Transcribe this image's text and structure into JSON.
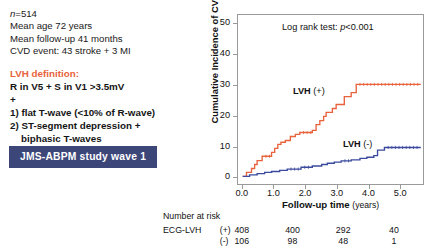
{
  "left_panel": {
    "cohort": [
      "n=514",
      "Mean age 72 years",
      "Mean follow-up 41 months",
      "CVD event: 43 stroke + 3 MI"
    ],
    "n_prefix_italic": "n",
    "lvh_definition_title": "LVH definition:",
    "definition_lines": [
      "R in V5 + S in V1 >3.5mV",
      "+",
      "1) flat T-wave (<10% of R-wave)",
      "2) ST-segment depression +",
      "biphasic T-waves"
    ],
    "badge_label": "JMS-ABPM study wave 1",
    "badge_bg": "#3c4679",
    "badge_fg": "#ffffff",
    "title_color": "#e8623c"
  },
  "chart_data": {
    "type": "line",
    "title": "",
    "xlabel": "Follow-up time",
    "xlabel_unit": "(years)",
    "ylabel": "Cumulative Incidence of CVD events (%)",
    "xlim": [
      -0.15,
      5.75
    ],
    "ylim": [
      -2.5,
      53
    ],
    "xticks": [
      0.0,
      1.0,
      2.0,
      3.0,
      4.0,
      5.0
    ],
    "xticklabels": [
      "0.0",
      "1.0",
      "2.0",
      "3.0",
      "4.0",
      "5.0"
    ],
    "yticks": [
      0,
      10,
      20,
      30,
      40,
      50
    ],
    "yticklabels": [
      "0",
      "10",
      "20",
      "30",
      "40",
      "50"
    ],
    "grid": false,
    "legend_position": "inline-annotation",
    "annotations": [
      {
        "name": "log-rank",
        "text_prefix": "Log rank test: ",
        "text_italic": "p",
        "text_suffix": "<0.001"
      },
      {
        "name": "curve-label-positive",
        "bold": "LVH",
        "rest": " (+)"
      },
      {
        "name": "curve-label-negative",
        "bold": "LVH",
        "rest": " (-)"
      }
    ],
    "series": [
      {
        "name": "LVH (+)",
        "color": "#e8623c",
        "style": "step-post",
        "points": [
          [
            0.0,
            0.0
          ],
          [
            0.12,
            0.0
          ],
          [
            0.12,
            1.3
          ],
          [
            0.28,
            1.3
          ],
          [
            0.28,
            2.6
          ],
          [
            0.38,
            2.6
          ],
          [
            0.38,
            3.9
          ],
          [
            0.46,
            3.9
          ],
          [
            0.46,
            5.2
          ],
          [
            0.62,
            5.2
          ],
          [
            0.62,
            6.6
          ],
          [
            0.92,
            6.6
          ],
          [
            0.92,
            7.9
          ],
          [
            1.02,
            7.9
          ],
          [
            1.02,
            9.2
          ],
          [
            1.12,
            9.2
          ],
          [
            1.12,
            10.5
          ],
          [
            1.22,
            10.5
          ],
          [
            1.22,
            11.2
          ],
          [
            1.36,
            11.2
          ],
          [
            1.36,
            11.8
          ],
          [
            1.52,
            11.8
          ],
          [
            1.52,
            13.1
          ],
          [
            1.68,
            13.1
          ],
          [
            1.68,
            13.8
          ],
          [
            1.82,
            13.8
          ],
          [
            1.82,
            14.4
          ],
          [
            2.22,
            14.4
          ],
          [
            2.22,
            15.1
          ],
          [
            2.34,
            15.1
          ],
          [
            2.34,
            17.0
          ],
          [
            2.46,
            17.0
          ],
          [
            2.46,
            18.3
          ],
          [
            2.58,
            18.3
          ],
          [
            2.58,
            19.7
          ],
          [
            2.66,
            19.7
          ],
          [
            2.66,
            21.0
          ],
          [
            2.86,
            21.0
          ],
          [
            2.86,
            22.3
          ],
          [
            2.98,
            22.3
          ],
          [
            2.98,
            23.6
          ],
          [
            3.24,
            23.6
          ],
          [
            3.24,
            26.2
          ],
          [
            3.46,
            26.2
          ],
          [
            3.46,
            27.5
          ],
          [
            3.62,
            27.5
          ],
          [
            3.62,
            30.2
          ],
          [
            5.68,
            30.2
          ]
        ]
      },
      {
        "name": "LVH (-)",
        "color": "#3b4a9e",
        "style": "step-post",
        "points": [
          [
            0.0,
            0.0
          ],
          [
            0.22,
            0.0
          ],
          [
            0.22,
            0.5
          ],
          [
            0.46,
            0.5
          ],
          [
            0.46,
            0.9
          ],
          [
            0.7,
            0.9
          ],
          [
            0.7,
            1.3
          ],
          [
            0.92,
            1.3
          ],
          [
            0.92,
            1.6
          ],
          [
            1.18,
            1.6
          ],
          [
            1.18,
            2.0
          ],
          [
            1.42,
            2.0
          ],
          [
            1.42,
            2.4
          ],
          [
            1.86,
            2.4
          ],
          [
            1.86,
            3.0
          ],
          [
            2.22,
            3.0
          ],
          [
            2.22,
            3.4
          ],
          [
            2.52,
            3.4
          ],
          [
            2.52,
            3.9
          ],
          [
            2.7,
            3.9
          ],
          [
            2.7,
            4.3
          ],
          [
            2.92,
            4.3
          ],
          [
            2.92,
            4.7
          ],
          [
            3.14,
            4.7
          ],
          [
            3.14,
            5.1
          ],
          [
            3.46,
            5.1
          ],
          [
            3.46,
            5.4
          ],
          [
            3.74,
            5.4
          ],
          [
            3.74,
            5.9
          ],
          [
            3.96,
            5.9
          ],
          [
            3.96,
            6.3
          ],
          [
            4.18,
            6.3
          ],
          [
            4.18,
            6.8
          ],
          [
            4.3,
            6.8
          ],
          [
            4.3,
            8.6
          ],
          [
            4.52,
            8.6
          ],
          [
            4.52,
            9.5
          ],
          [
            5.68,
            9.5
          ]
        ]
      }
    ]
  },
  "risk_table": {
    "title": "Number at risk",
    "row_label": "ECG-LVH",
    "rows": [
      {
        "sign": "(+)",
        "values": [
          "408",
          "400",
          "292",
          "40"
        ]
      },
      {
        "sign": "(-)",
        "values": [
          "106",
          "98",
          "48",
          "1"
        ]
      }
    ],
    "value_x_times": [
      0.0,
      1.6,
      3.2,
      4.8
    ]
  }
}
